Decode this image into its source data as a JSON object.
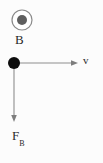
{
  "figure": {
    "background_color": "#fcfcfc",
    "width": 103,
    "height": 163
  },
  "field_symbol": {
    "name": "magnetic-field-out-of-page",
    "glyph": "circle-with-dot",
    "ring_color": "#8a8a8a",
    "dot_color": "#5e5e5e",
    "center_x": 22,
    "center_y": 20,
    "outer_radius": 10.5,
    "inner_radius": 5
  },
  "labels": {
    "field": "B",
    "velocity": "v",
    "force_main": "F",
    "force_sub": "B"
  },
  "particle": {
    "name": "charged-particle",
    "color": "#0d0d0d",
    "center_x": 14,
    "center_y": 63,
    "radius": 6
  },
  "velocity_vector": {
    "name": "velocity-arrow",
    "color": "#8d8d8d",
    "from_x": 14,
    "from_y": 63,
    "to_x": 78,
    "to_y": 63,
    "direction": "right"
  },
  "force_vector": {
    "name": "magnetic-force-arrow",
    "color": "#8d8d8d",
    "from_x": 14,
    "from_y": 63,
    "to_x": 14,
    "to_y": 122,
    "direction": "down"
  }
}
